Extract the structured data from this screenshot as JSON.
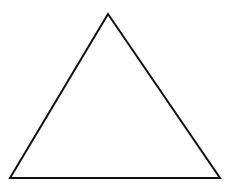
{
  "diagram": {
    "shape": "triangle",
    "width": 236,
    "height": 186,
    "background": "#ffffff",
    "stroke": "#111111",
    "stroke_width": 2,
    "fill": "none",
    "vertices": {
      "apex": [
        108,
        14
      ],
      "bottom_left": [
        10,
        178
      ],
      "bottom_right": [
        220,
        178
      ]
    }
  }
}
